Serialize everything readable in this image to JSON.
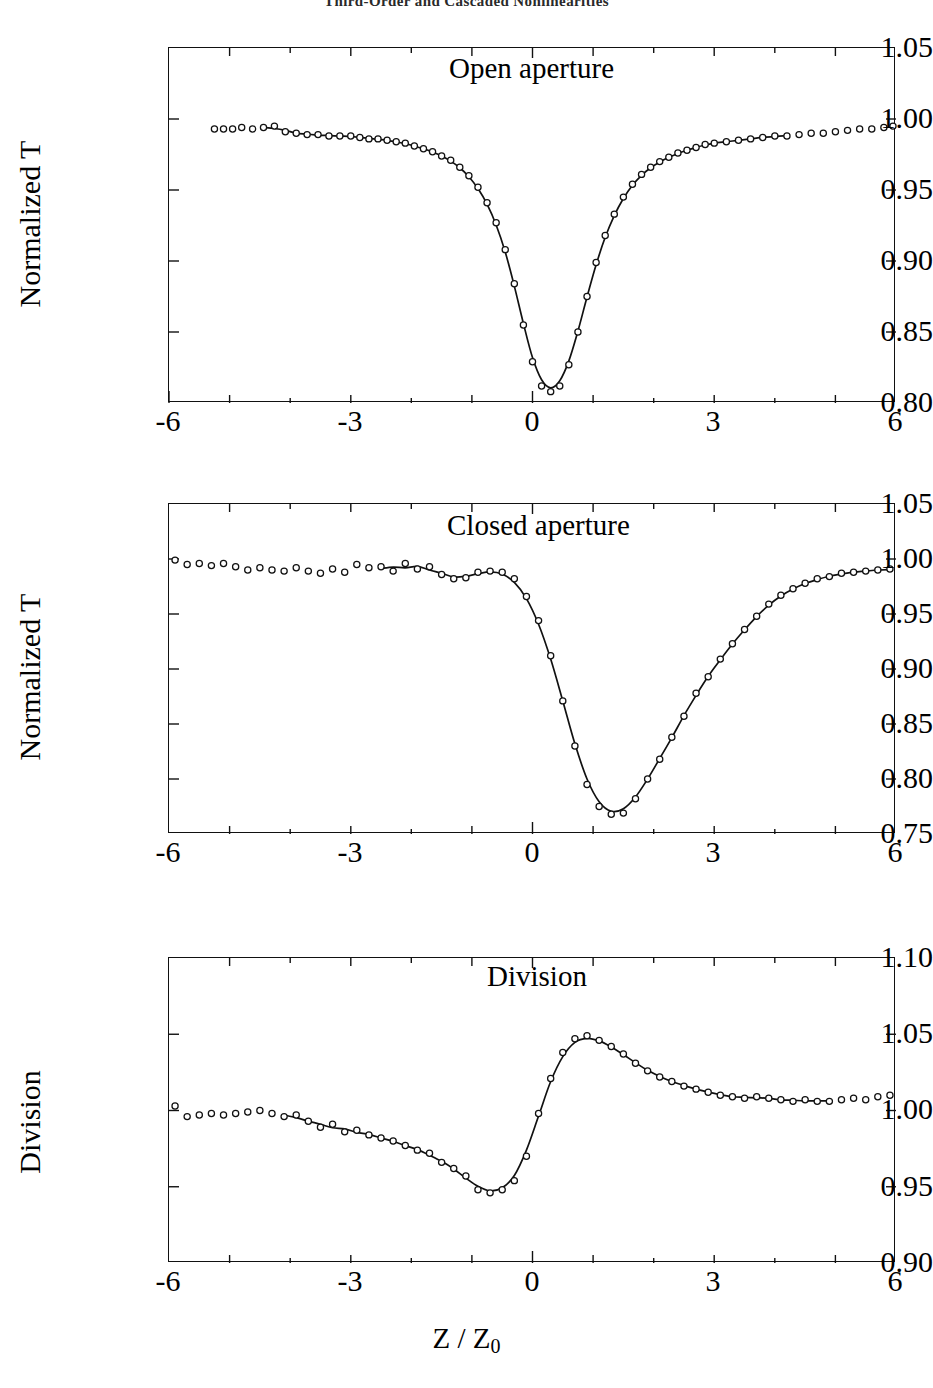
{
  "running_head": "Third-Order and Cascaded Nonlinearities",
  "figure": {
    "x_axis_title": "Z / Z",
    "x_axis_title_sub": "0"
  },
  "panels": [
    {
      "id": "open-aperture",
      "title": "Open aperture",
      "ylabel": "Normalized T",
      "ytick_labels": [
        "1.05",
        "1.00",
        "0.95",
        "0.90",
        "0.85",
        "0.80"
      ],
      "xtick_labels": [
        "-6",
        "-3",
        "0",
        "3",
        "6"
      ]
    },
    {
      "id": "closed-aperture",
      "title": "Closed aperture",
      "ylabel": "Normalized T",
      "ytick_labels": [
        "1.05",
        "1.00",
        "0.95",
        "0.90",
        "0.85",
        "0.80",
        "0.75"
      ],
      "xtick_labels": [
        "-6",
        "-3",
        "0",
        "3",
        "6"
      ]
    },
    {
      "id": "division",
      "title": "Division",
      "ylabel": "Division",
      "ytick_labels": [
        "1.10",
        "1.05",
        "1.00",
        "0.95",
        "0.90"
      ],
      "xtick_labels": [
        "-6",
        "-3",
        "0",
        "3",
        "6"
      ]
    }
  ],
  "chart_data": [
    {
      "type": "scatter",
      "id": "open-aperture",
      "title": "Open aperture",
      "xlabel": "Z / Z0",
      "ylabel": "Normalized T",
      "xlim": [
        -6,
        6
      ],
      "ylim": [
        0.8,
        1.05
      ],
      "xticks": [
        -6,
        -3,
        0,
        3,
        6
      ],
      "yticks": [
        0.8,
        0.85,
        0.9,
        0.95,
        1.0,
        1.05
      ],
      "grid": false,
      "legend": "none",
      "marker": "open-circle",
      "series": [
        {
          "name": "data",
          "x": [
            -5.25,
            -5.1,
            -4.95,
            -4.8,
            -4.62,
            -4.44,
            -4.26,
            -4.08,
            -3.9,
            -3.72,
            -3.54,
            -3.36,
            -3.18,
            -3.0,
            -2.85,
            -2.7,
            -2.55,
            -2.4,
            -2.25,
            -2.1,
            -1.95,
            -1.8,
            -1.65,
            -1.5,
            -1.35,
            -1.2,
            -1.05,
            -0.9,
            -0.75,
            -0.6,
            -0.45,
            -0.3,
            -0.15,
            0.0,
            0.15,
            0.3,
            0.45,
            0.6,
            0.75,
            0.9,
            1.05,
            1.2,
            1.35,
            1.5,
            1.65,
            1.8,
            1.95,
            2.1,
            2.25,
            2.4,
            2.55,
            2.7,
            2.85,
            3.0,
            3.2,
            3.4,
            3.6,
            3.8,
            4.0,
            4.2,
            4.4,
            4.6,
            4.8,
            5.0,
            5.2,
            5.4,
            5.6,
            5.8,
            5.95
          ],
          "y": [
            0.993,
            0.993,
            0.993,
            0.994,
            0.993,
            0.994,
            0.995,
            0.991,
            0.99,
            0.989,
            0.989,
            0.988,
            0.988,
            0.988,
            0.987,
            0.986,
            0.986,
            0.985,
            0.984,
            0.983,
            0.981,
            0.979,
            0.977,
            0.974,
            0.971,
            0.966,
            0.96,
            0.952,
            0.941,
            0.927,
            0.908,
            0.884,
            0.855,
            0.829,
            0.812,
            0.808,
            0.812,
            0.827,
            0.85,
            0.875,
            0.899,
            0.918,
            0.933,
            0.945,
            0.954,
            0.961,
            0.966,
            0.97,
            0.973,
            0.976,
            0.978,
            0.98,
            0.982,
            0.983,
            0.984,
            0.985,
            0.986,
            0.987,
            0.988,
            0.988,
            0.989,
            0.99,
            0.99,
            0.991,
            0.992,
            0.993,
            0.993,
            0.994,
            0.995
          ]
        },
        {
          "name": "fit",
          "type": "line",
          "note": "Smooth theoretical Z-scan open-aperture fit, minimum T = 0.808 at Z/Z0 = 0.15"
        }
      ]
    },
    {
      "type": "scatter",
      "id": "closed-aperture",
      "title": "Closed aperture",
      "xlabel": "Z / Z0",
      "ylabel": "Normalized T",
      "xlim": [
        -6,
        6
      ],
      "ylim": [
        0.75,
        1.05
      ],
      "xticks": [
        -6,
        -3,
        0,
        3,
        6
      ],
      "yticks": [
        0.75,
        0.8,
        0.85,
        0.9,
        0.95,
        1.0,
        1.05
      ],
      "grid": false,
      "legend": "none",
      "marker": "open-circle",
      "series": [
        {
          "name": "data",
          "x": [
            -5.9,
            -5.7,
            -5.5,
            -5.3,
            -5.1,
            -4.9,
            -4.7,
            -4.5,
            -4.3,
            -4.1,
            -3.9,
            -3.7,
            -3.5,
            -3.3,
            -3.1,
            -2.9,
            -2.7,
            -2.5,
            -2.3,
            -2.1,
            -1.9,
            -1.7,
            -1.5,
            -1.3,
            -1.1,
            -0.9,
            -0.7,
            -0.5,
            -0.3,
            -0.1,
            0.1,
            0.3,
            0.5,
            0.7,
            0.9,
            1.1,
            1.3,
            1.5,
            1.7,
            1.9,
            2.1,
            2.3,
            2.5,
            2.7,
            2.9,
            3.1,
            3.3,
            3.5,
            3.7,
            3.9,
            4.1,
            4.3,
            4.5,
            4.7,
            4.9,
            5.1,
            5.3,
            5.5,
            5.7,
            5.9
          ],
          "y": [
            0.999,
            0.995,
            0.996,
            0.994,
            0.996,
            0.993,
            0.99,
            0.992,
            0.99,
            0.989,
            0.992,
            0.989,
            0.987,
            0.991,
            0.988,
            0.995,
            0.992,
            0.993,
            0.989,
            0.996,
            0.991,
            0.993,
            0.986,
            0.982,
            0.983,
            0.988,
            0.989,
            0.988,
            0.982,
            0.966,
            0.944,
            0.912,
            0.871,
            0.83,
            0.795,
            0.775,
            0.768,
            0.769,
            0.782,
            0.8,
            0.818,
            0.838,
            0.857,
            0.878,
            0.893,
            0.909,
            0.923,
            0.936,
            0.948,
            0.959,
            0.967,
            0.973,
            0.978,
            0.982,
            0.984,
            0.987,
            0.988,
            0.989,
            0.99,
            0.991
          ]
        },
        {
          "name": "fit",
          "type": "line",
          "note": "Smooth closed-aperture Z-scan fit, minimum T = 0.782 at Z/Z0 = 0.45"
        }
      ]
    },
    {
      "type": "scatter",
      "id": "division",
      "title": "Division",
      "xlabel": "Z / Z0",
      "ylabel": "Division",
      "xlim": [
        -6,
        6
      ],
      "ylim": [
        0.9,
        1.1
      ],
      "xticks": [
        -6,
        -3,
        0,
        3,
        6
      ],
      "yticks": [
        0.9,
        0.95,
        1.0,
        1.05,
        1.1
      ],
      "grid": false,
      "legend": "none",
      "marker": "open-circle",
      "series": [
        {
          "name": "data",
          "x": [
            -5.9,
            -5.7,
            -5.5,
            -5.3,
            -5.1,
            -4.9,
            -4.7,
            -4.5,
            -4.3,
            -4.1,
            -3.9,
            -3.7,
            -3.5,
            -3.3,
            -3.1,
            -2.9,
            -2.7,
            -2.5,
            -2.3,
            -2.1,
            -1.9,
            -1.7,
            -1.5,
            -1.3,
            -1.1,
            -0.9,
            -0.7,
            -0.5,
            -0.3,
            -0.1,
            0.1,
            0.3,
            0.5,
            0.7,
            0.9,
            1.1,
            1.3,
            1.5,
            1.7,
            1.9,
            2.1,
            2.3,
            2.5,
            2.7,
            2.9,
            3.1,
            3.3,
            3.5,
            3.7,
            3.9,
            4.1,
            4.3,
            4.5,
            4.7,
            4.9,
            5.1,
            5.3,
            5.5,
            5.7,
            5.9
          ],
          "y": [
            1.003,
            0.996,
            0.997,
            0.998,
            0.997,
            0.998,
            0.999,
            1.0,
            0.998,
            0.996,
            0.997,
            0.993,
            0.989,
            0.991,
            0.986,
            0.987,
            0.984,
            0.982,
            0.98,
            0.977,
            0.974,
            0.972,
            0.966,
            0.962,
            0.957,
            0.948,
            0.946,
            0.948,
            0.954,
            0.97,
            0.998,
            1.021,
            1.038,
            1.047,
            1.049,
            1.046,
            1.042,
            1.037,
            1.031,
            1.026,
            1.022,
            1.019,
            1.016,
            1.014,
            1.012,
            1.01,
            1.009,
            1.008,
            1.009,
            1.008,
            1.007,
            1.006,
            1.007,
            1.006,
            1.006,
            1.007,
            1.008,
            1.007,
            1.009,
            1.01
          ]
        },
        {
          "name": "fit",
          "type": "line",
          "note": "Smooth division curve (closed/open), valley 0.948 at Z/Z0 = -0.8, peak 1.049 at Z/Z0 = 0.9"
        }
      ]
    }
  ]
}
